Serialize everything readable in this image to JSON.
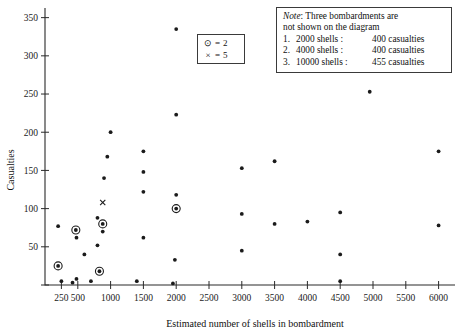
{
  "chart_data": {
    "type": "scatter",
    "title": "",
    "xlabel": "Estimated number of shells in bombardment",
    "ylabel": "Casualties",
    "xlim": [
      0,
      6250
    ],
    "ylim": [
      0,
      360
    ],
    "grid": false,
    "xticks": [
      250,
      500,
      1000,
      1500,
      2000,
      2500,
      3000,
      3500,
      4000,
      4500,
      5000,
      5500,
      6000
    ],
    "xtick_labels": [
      "250",
      "500",
      "1000",
      "1500",
      "2000",
      "2500",
      "3000",
      "3500",
      "4000",
      "4500",
      "5000",
      "5500",
      "6000"
    ],
    "yticks": [
      0,
      50,
      100,
      150,
      200,
      250,
      300,
      350
    ],
    "ytick_labels": [
      "",
      "50",
      "100",
      "150",
      "200",
      "250",
      "300",
      "350"
    ],
    "marker_multiplicity": {
      "dot": 1,
      "ringed_dot": 2,
      "cross": 5
    },
    "points": [
      {
        "x": 200,
        "y": 25,
        "marker": "ringed_dot",
        "count": 2
      },
      {
        "x": 200,
        "y": 77,
        "marker": "dot",
        "count": 1
      },
      {
        "x": 250,
        "y": 5,
        "marker": "dot",
        "count": 1
      },
      {
        "x": 420,
        "y": 3,
        "marker": "dot",
        "count": 1
      },
      {
        "x": 480,
        "y": 8,
        "marker": "dot",
        "count": 1
      },
      {
        "x": 480,
        "y": 62,
        "marker": "dot",
        "count": 1
      },
      {
        "x": 470,
        "y": 72,
        "marker": "ringed_dot",
        "count": 2
      },
      {
        "x": 600,
        "y": 40,
        "marker": "dot",
        "count": 1
      },
      {
        "x": 700,
        "y": 5,
        "marker": "dot",
        "count": 1
      },
      {
        "x": 800,
        "y": 52,
        "marker": "dot",
        "count": 1
      },
      {
        "x": 800,
        "y": 88,
        "marker": "dot",
        "count": 1
      },
      {
        "x": 830,
        "y": 18,
        "marker": "ringed_dot",
        "count": 2
      },
      {
        "x": 880,
        "y": 80,
        "marker": "ringed_dot",
        "count": 2
      },
      {
        "x": 880,
        "y": 70,
        "marker": "dot",
        "count": 1
      },
      {
        "x": 880,
        "y": 108,
        "marker": "cross",
        "count": 5
      },
      {
        "x": 900,
        "y": 140,
        "marker": "dot",
        "count": 1
      },
      {
        "x": 950,
        "y": 168,
        "marker": "dot",
        "count": 1
      },
      {
        "x": 1000,
        "y": 200,
        "marker": "dot",
        "count": 1
      },
      {
        "x": 1400,
        "y": 5,
        "marker": "dot",
        "count": 1
      },
      {
        "x": 1500,
        "y": 62,
        "marker": "dot",
        "count": 1
      },
      {
        "x": 1500,
        "y": 122,
        "marker": "dot",
        "count": 1
      },
      {
        "x": 1500,
        "y": 148,
        "marker": "dot",
        "count": 1
      },
      {
        "x": 1500,
        "y": 175,
        "marker": "dot",
        "count": 1
      },
      {
        "x": 1950,
        "y": 2,
        "marker": "dot",
        "count": 1
      },
      {
        "x": 1980,
        "y": 33,
        "marker": "dot",
        "count": 1
      },
      {
        "x": 2000,
        "y": 100,
        "marker": "ringed_dot",
        "count": 2
      },
      {
        "x": 2000,
        "y": 118,
        "marker": "dot",
        "count": 1
      },
      {
        "x": 2000,
        "y": 223,
        "marker": "dot",
        "count": 1
      },
      {
        "x": 2000,
        "y": 335,
        "marker": "dot",
        "count": 1
      },
      {
        "x": 3000,
        "y": 45,
        "marker": "dot",
        "count": 1
      },
      {
        "x": 3000,
        "y": 93,
        "marker": "dot",
        "count": 1
      },
      {
        "x": 3000,
        "y": 153,
        "marker": "dot",
        "count": 1
      },
      {
        "x": 3500,
        "y": 80,
        "marker": "dot",
        "count": 1
      },
      {
        "x": 3500,
        "y": 162,
        "marker": "dot",
        "count": 1
      },
      {
        "x": 4000,
        "y": 83,
        "marker": "dot",
        "count": 1
      },
      {
        "x": 4500,
        "y": 5,
        "marker": "dot",
        "count": 1
      },
      {
        "x": 4500,
        "y": 40,
        "marker": "dot",
        "count": 1
      },
      {
        "x": 4500,
        "y": 95,
        "marker": "dot",
        "count": 1
      },
      {
        "x": 4950,
        "y": 253,
        "marker": "dot",
        "count": 1
      },
      {
        "x": 6000,
        "y": 78,
        "marker": "dot",
        "count": 1
      },
      {
        "x": 6000,
        "y": 175,
        "marker": "dot",
        "count": 1
      }
    ]
  },
  "legend": {
    "rows": [
      {
        "symbol": "⊙",
        "label": "= 2"
      },
      {
        "symbol": "×",
        "label": "= 5"
      }
    ]
  },
  "note": {
    "label": "Note",
    "head": ": Three bombardments are",
    "line2": "not shown on the diagram",
    "items": [
      {
        "num": "1.",
        "shells": "2000 shells :",
        "casualties": "400 casualties"
      },
      {
        "num": "2.",
        "shells": "4000 shells :",
        "casualties": "400 casualties"
      },
      {
        "num": "3.",
        "shells": "10000 shells :",
        "casualties": "455 casualties"
      }
    ]
  }
}
